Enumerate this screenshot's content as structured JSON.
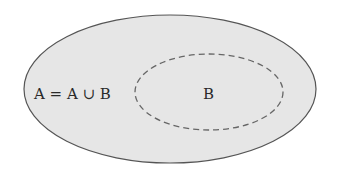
{
  "diagram": {
    "type": "venn",
    "outer_set": {
      "label": "A = A ∪ B",
      "fill": "#e6e6e6",
      "stroke": "#555555",
      "style": "solid"
    },
    "inner_set": {
      "label": "B",
      "stroke": "#666666",
      "style": "dashed"
    }
  }
}
